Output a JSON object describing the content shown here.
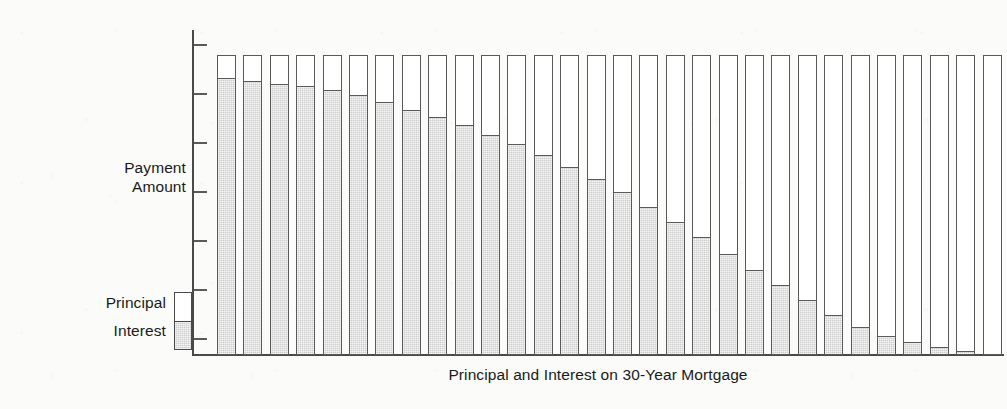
{
  "chart_data": {
    "type": "bar",
    "subtype": "stacked-bar",
    "title": "",
    "xlabel": "Principal and Interest on 30-Year Mortgage",
    "ylabel": "Payment Amount",
    "grid": false,
    "legend_position": "left-bottom",
    "y_axis": {
      "tick_labels": [],
      "tick_count": 7,
      "labeled": false,
      "ylim": [
        0,
        110
      ]
    },
    "x_axis": {
      "tick_labels": [],
      "labeled": false,
      "category_meaning": "year of loan (1 through 30)"
    },
    "categories": [
      "1",
      "2",
      "3",
      "4",
      "5",
      "6",
      "7",
      "8",
      "9",
      "10",
      "11",
      "12",
      "13",
      "14",
      "15",
      "16",
      "17",
      "18",
      "19",
      "20",
      "21",
      "22",
      "23",
      "24",
      "25",
      "26",
      "27",
      "28",
      "29",
      "30"
    ],
    "series": [
      {
        "name": "Interest",
        "color": "#cdcdcd",
        "values": [
          92.0,
          91.0,
          90.0,
          89.5,
          88.0,
          86.5,
          84.0,
          81.5,
          79.0,
          76.5,
          73.0,
          70.0,
          66.5,
          62.5,
          58.5,
          54.0,
          49.0,
          44.0,
          39.0,
          33.5,
          28.0,
          23.0,
          18.0,
          13.0,
          9.0,
          6.0,
          4.0,
          2.5,
          1.0,
          0.0
        ]
      },
      {
        "name": "Principal",
        "color": "#ffffff",
        "values": [
          8.0,
          9.0,
          10.0,
          10.5,
          12.0,
          13.5,
          16.0,
          18.5,
          21.0,
          23.5,
          27.0,
          30.0,
          33.5,
          37.5,
          41.5,
          46.0,
          51.0,
          56.0,
          61.0,
          66.5,
          72.0,
          77.0,
          82.0,
          87.0,
          91.0,
          94.0,
          96.0,
          97.5,
          99.0,
          100.0
        ]
      }
    ],
    "bar_total": 100,
    "note": "Each bar is the same total payment amount; interest share declines and principal share rises over the 30 years."
  },
  "axis_titles": {
    "y": "Payment\nAmount",
    "x": "Principal and Interest on 30-Year Mortgage"
  },
  "legend": {
    "principal_label": "Principal",
    "interest_label": "Interest",
    "principal_color": "#ffffff",
    "interest_color": "#cdcdcd"
  },
  "style": {
    "background": "#fbfbf9",
    "ink": "#1a1a1a",
    "axis_color": "#4a4a4a",
    "bar_outline": "#5a5a5a"
  }
}
